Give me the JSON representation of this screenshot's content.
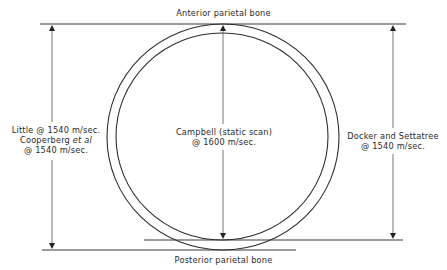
{
  "diagram": {
    "labels": {
      "top": "Anterior parietal bone",
      "bottom": "Posterior parietal bone",
      "left_line1": "Little @ 1540 m/sec.",
      "left_line2_name": "Cooperberg",
      "left_line2_italic": "et al",
      "left_line3": "@ 1540 m/sec.",
      "center_line1": "Campbell (static scan)",
      "center_line2": "@ 1600 m/sec.",
      "right_line1": "Docker and Settatree",
      "right_line2": "@ 1540 m/sec."
    },
    "measurements": [
      {
        "name": "Little / Cooperberg et al",
        "velocity": "1540 m/sec.",
        "from": "outer table anterior",
        "to": "outer table posterior"
      },
      {
        "name": "Campbell (static scan)",
        "velocity": "1600 m/sec.",
        "from": "outer table anterior",
        "to": "inner table posterior"
      },
      {
        "name": "Docker and Settatree",
        "velocity": "1540 m/sec.",
        "from": "outer table anterior",
        "to": "inner table posterior"
      }
    ],
    "colors": {
      "line": "#3a3a3a",
      "text": "#2a2a2a",
      "background": "#ffffff"
    }
  }
}
